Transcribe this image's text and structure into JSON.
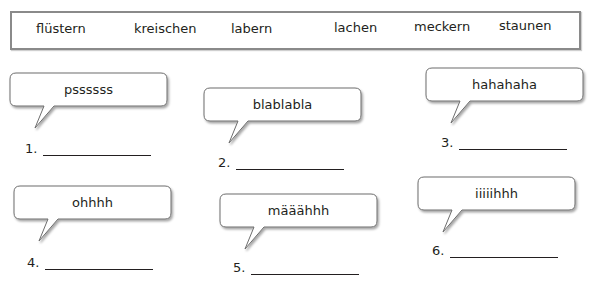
{
  "word_bank": {
    "words": [
      "flüstern",
      "kreischen",
      "labern",
      "lachen",
      "meckern",
      "staunen"
    ]
  },
  "exercises": [
    {
      "number": "1.",
      "sound": "pssssss",
      "answer": ""
    },
    {
      "number": "2.",
      "sound": "blablabla",
      "answer": ""
    },
    {
      "number": "3.",
      "sound": "hahahaha",
      "answer": ""
    },
    {
      "number": "4.",
      "sound": "ohhhh",
      "answer": ""
    },
    {
      "number": "5.",
      "sound": "määähhh",
      "answer": ""
    },
    {
      "number": "6.",
      "sound": "iiiiihhh",
      "answer": ""
    }
  ],
  "colors": {
    "border": "#8a8a8a",
    "text": "#231f20",
    "bubble_fill": "#ffffff",
    "bubble_stroke": "#6d6d6d"
  }
}
